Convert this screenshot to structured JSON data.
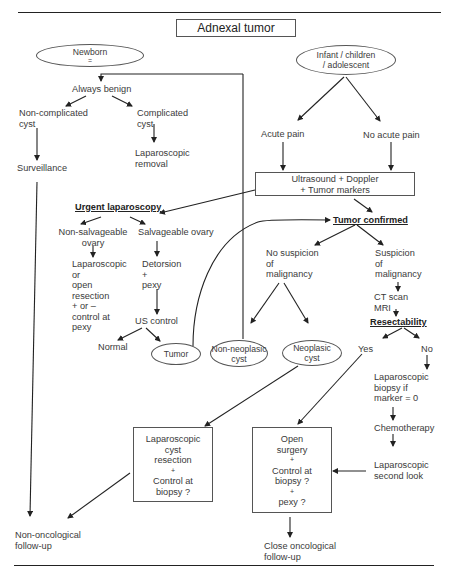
{
  "title": "Adnexal tumor",
  "nodes": {
    "newborn": {
      "line1": "Newborn",
      "line2": "="
    },
    "infant": {
      "line1": "Infant / children",
      "line2": "/ adolescent"
    },
    "always_benign": "Always benign",
    "non_complicated": {
      "line1": "Non-complicated",
      "line2": "cyst"
    },
    "complicated": {
      "line1": "Complicated",
      "line2": "cyst"
    },
    "lap_removal": {
      "line1": "Laparoscopic",
      "line2": "removal"
    },
    "surveillance": "Surveillance",
    "acute_pain": "Acute pain",
    "no_acute_pain": "No acute pain",
    "ultrasound": {
      "line1": "Ultrasound + Doppler",
      "line2": "+ Tumor markers"
    },
    "urgent_laparoscopy": "Urgent laparoscopy",
    "non_salvageable": {
      "line1": "Non-salvageable",
      "line2": "ovary"
    },
    "salvageable": "Salvageable ovary",
    "lap_open_resection": [
      "Laparoscopic",
      "or",
      "open",
      "resection",
      "+ or –",
      "control at",
      "pexy"
    ],
    "detorsion": [
      "Detorsion",
      "+",
      "pexy"
    ],
    "us_control": "US control",
    "normal": "Normal",
    "tumor": "Tumor",
    "tumor_confirmed": "Tumor confirmed",
    "no_suspicion": [
      "No suspicion",
      "of",
      "malignancy"
    ],
    "suspicion": [
      "Suspicion",
      "of",
      "malignancy"
    ],
    "ct_mri": [
      "CT scan",
      "MRI"
    ],
    "resectability": "Resectability",
    "yes": "Yes",
    "no": "No",
    "non_neoplasic": {
      "line1": "Non-neoplasic",
      "line2": "cyst"
    },
    "neoplasic": {
      "line1": "Neoplasic",
      "line2": "cyst"
    },
    "lap_biopsy": [
      "Laparoscopic",
      "biopsy if",
      "marker = 0"
    ],
    "chemotherapy": "Chemotherapy",
    "lap_second_look": [
      "Laparoscopic",
      "second look"
    ],
    "lap_cyst_resection": [
      "Laparoscopic",
      "cyst",
      "resection",
      "+",
      "Control at",
      "biopsy ?"
    ],
    "open_surgery": [
      "Open",
      "surgery",
      "+",
      "Control at",
      "biopsy ?",
      "+",
      "pexy ?"
    ],
    "non_oncological": [
      "Non-oncological",
      "follow-up"
    ],
    "close_oncological": [
      "Close oncological",
      "follow-up"
    ]
  },
  "colors": {
    "line": "#222222",
    "text": "#3a3a3a",
    "border": "#555555"
  }
}
